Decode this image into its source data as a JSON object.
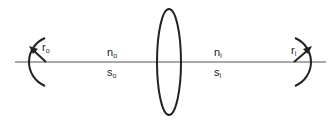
{
  "diagram": {
    "type": "optical-imaging-setup",
    "elements": [
      {
        "id": "object-surface",
        "shape": "concave-arc-left",
        "radius_label": {
          "base": "r",
          "sub": "o"
        }
      },
      {
        "id": "lens",
        "shape": "thin-ellipse"
      },
      {
        "id": "image-surface",
        "shape": "concave-arc-right",
        "radius_label": {
          "base": "r",
          "sub": "i"
        }
      }
    ],
    "labels": {
      "object_index": {
        "base": "n",
        "sub": "o"
      },
      "object_distance": {
        "base": "s",
        "sub": "o"
      },
      "image_index": {
        "base": "n",
        "sub": "i"
      },
      "image_distance": {
        "base": "s",
        "sub": "i"
      }
    },
    "colors": {
      "stroke": "#222222",
      "axis": "#555555",
      "background": "#ffffff"
    }
  }
}
